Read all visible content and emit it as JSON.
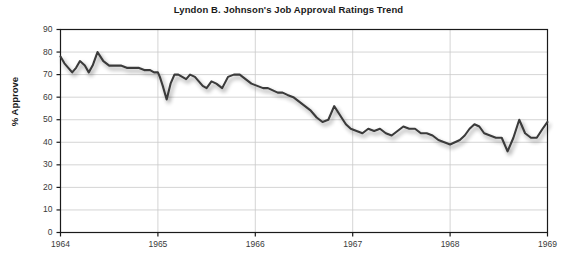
{
  "chart_data": {
    "type": "line",
    "title": "Lyndon B. Johnson's Job Approval Ratings Trend",
    "xlabel": "",
    "ylabel": "% Approve",
    "xlim": [
      1964,
      1969
    ],
    "ylim": [
      0,
      90
    ],
    "grid": true,
    "legend": null,
    "xticks": [
      "1964",
      "1965",
      "1966",
      "1967",
      "1968",
      "1969"
    ],
    "xtick_values": [
      1964,
      1965,
      1966,
      1967,
      1968,
      1969
    ],
    "yticks": [
      "0",
      "10",
      "20",
      "30",
      "40",
      "50",
      "60",
      "70",
      "80",
      "90"
    ],
    "ytick_values": [
      0,
      10,
      20,
      30,
      40,
      50,
      60,
      70,
      80,
      90
    ],
    "line_color": "#3b3b3b",
    "series": [
      {
        "name": "% Approve",
        "x": [
          1964.0,
          1964.04,
          1964.08,
          1964.12,
          1964.16,
          1964.2,
          1964.25,
          1964.29,
          1964.33,
          1964.38,
          1964.44,
          1964.5,
          1964.56,
          1964.62,
          1964.68,
          1964.74,
          1964.8,
          1964.86,
          1964.92,
          1964.96,
          1965.0,
          1965.02,
          1965.05,
          1965.09,
          1965.13,
          1965.17,
          1965.21,
          1965.25,
          1965.29,
          1965.33,
          1965.38,
          1965.42,
          1965.46,
          1965.5,
          1965.55,
          1965.6,
          1965.66,
          1965.72,
          1965.78,
          1965.84,
          1965.9,
          1965.96,
          1966.02,
          1966.08,
          1966.13,
          1966.18,
          1966.23,
          1966.28,
          1966.33,
          1966.39,
          1966.45,
          1966.51,
          1966.57,
          1966.63,
          1966.69,
          1966.75,
          1966.81,
          1966.87,
          1966.93,
          1966.98,
          1967.04,
          1967.1,
          1967.16,
          1967.22,
          1967.28,
          1967.34,
          1967.4,
          1967.46,
          1967.52,
          1967.58,
          1967.64,
          1967.7,
          1967.76,
          1967.82,
          1967.88,
          1967.94,
          1968.0,
          1968.05,
          1968.1,
          1968.15,
          1968.2,
          1968.25,
          1968.3,
          1968.35,
          1968.41,
          1968.47,
          1968.53,
          1968.59,
          1968.65,
          1968.71,
          1968.77,
          1968.83,
          1968.89,
          1968.95,
          1969.0
        ],
        "values": [
          78,
          75,
          73,
          71,
          73,
          76,
          74,
          71,
          74,
          80,
          76,
          74,
          74,
          74,
          73,
          73,
          73,
          72,
          72,
          71,
          71,
          69,
          65,
          59,
          66,
          70,
          70,
          69,
          68,
          70,
          69,
          67,
          65,
          64,
          67,
          66,
          64,
          69,
          70,
          70,
          68,
          66,
          65,
          64,
          64,
          63,
          62,
          62,
          61,
          60,
          58,
          56,
          54,
          51,
          49,
          50,
          56,
          52,
          48,
          46,
          45,
          44,
          46,
          45,
          46,
          44,
          43,
          45,
          47,
          46,
          46,
          44,
          44,
          43,
          41,
          40,
          39,
          40,
          41,
          43,
          46,
          48,
          47,
          44,
          43,
          42,
          42,
          36,
          42,
          50,
          44,
          42,
          42,
          46,
          49
        ]
      }
    ]
  },
  "axes": {
    "y_title": "% Approve",
    "x_tick_labels": [
      "1964",
      "1965",
      "1966",
      "1967",
      "1968",
      "1969"
    ],
    "y_tick_labels": [
      "90",
      "80",
      "70",
      "60",
      "50",
      "40",
      "30",
      "20",
      "10",
      "0"
    ]
  },
  "style": {
    "line_color": "#3b3b3b",
    "grid_color": "#c9c9c9",
    "frame_color": "#1a1a1a",
    "background": "#ffffff"
  }
}
